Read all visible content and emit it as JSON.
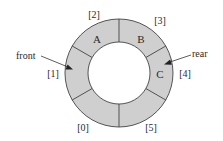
{
  "colors": {
    "ring_fill": "#cfcfcf",
    "stroke": "#444444",
    "background": "#ffffff",
    "text": "#2a2a2a"
  },
  "ring": {
    "center": [
      119,
      73
    ],
    "outer_radius": 54,
    "inner_radius": 31,
    "slots": [
      {
        "index_label": "[0]",
        "value": ""
      },
      {
        "index_label": "[1]",
        "value": ""
      },
      {
        "index_label": "[2]",
        "value": "A"
      },
      {
        "index_label": "[3]",
        "value": "B"
      },
      {
        "index_label": "[4]",
        "value": "C"
      },
      {
        "index_label": "[5]",
        "value": ""
      }
    ]
  },
  "pointers": {
    "front": {
      "label": "front",
      "points_to_index": 1
    },
    "rear": {
      "label": "rear",
      "points_to_index": 4
    }
  }
}
